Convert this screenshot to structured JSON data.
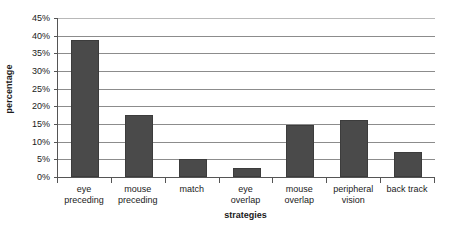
{
  "chart_data": {
    "type": "bar",
    "title": "",
    "xlabel": "strategies",
    "ylabel": "percentage",
    "categories": [
      "eye preceding",
      "mouse preceding",
      "match",
      "eye overlap",
      "mouse overlap",
      "peripheral vision",
      "back track"
    ],
    "category_lines": [
      [
        "eye",
        "preceding"
      ],
      [
        "mouse",
        "preceding"
      ],
      [
        "match",
        ""
      ],
      [
        "eye",
        "overlap"
      ],
      [
        "mouse",
        "overlap"
      ],
      [
        "peripheral",
        "vision"
      ],
      [
        "back track",
        ""
      ]
    ],
    "values": [
      38.7,
      17.6,
      5.0,
      2.6,
      14.6,
      16.0,
      7.0
    ],
    "ylim": [
      0,
      45
    ],
    "ytick_step": 5,
    "ytick_labels": [
      "0%",
      "5%",
      "10%",
      "15%",
      "20%",
      "25%",
      "30%",
      "35%",
      "40%",
      "45%"
    ],
    "ytick_values": [
      0,
      5,
      10,
      15,
      20,
      25,
      30,
      35,
      40,
      45
    ],
    "grid": true,
    "legend": false,
    "bar_color": "#4a4a4a",
    "grid_color": "#8c8c8c",
    "axis_color": "#555555",
    "background_color": "#ffffff"
  }
}
